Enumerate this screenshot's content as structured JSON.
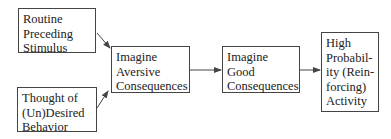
{
  "diagram": {
    "boxes": [
      {
        "id": "routine",
        "lines": [
          "Routine",
          "Preceding",
          "Stimulus"
        ]
      },
      {
        "id": "thought",
        "lines": [
          "Thought of",
          "(Un)Desired",
          "Behavior"
        ]
      },
      {
        "id": "aversive",
        "lines": [
          "Imagine",
          "Aversive",
          "Consequences"
        ]
      },
      {
        "id": "good",
        "lines": [
          "Imagine",
          "Good",
          "Consequences"
        ]
      },
      {
        "id": "high-prob",
        "lines": [
          "High",
          "Probabil-",
          "ity (Rein-",
          "forcing)",
          "Activity"
        ]
      }
    ],
    "edges": [
      {
        "from": "routine",
        "to": "aversive"
      },
      {
        "from": "thought",
        "to": "aversive"
      },
      {
        "from": "aversive",
        "to": "good"
      },
      {
        "from": "good",
        "to": "high-prob"
      }
    ],
    "colors": {
      "line": "#444444",
      "text": "#222222"
    }
  }
}
